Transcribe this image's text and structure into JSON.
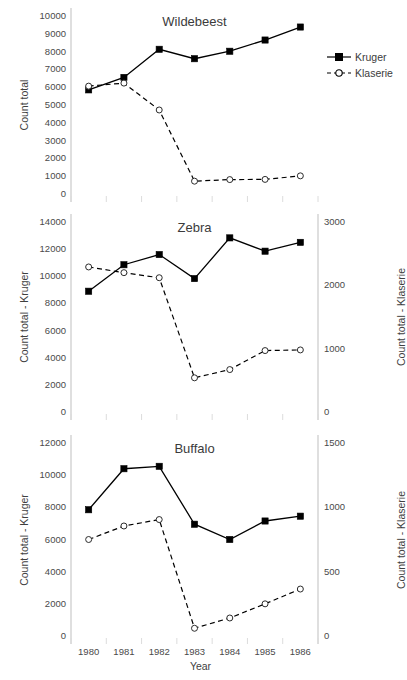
{
  "figure": {
    "xlabel": "Year",
    "legend": {
      "position": "top-right",
      "entries": [
        {
          "label": "Kruger",
          "marker": "filled-square",
          "line": "solid"
        },
        {
          "label": "Klaserie",
          "marker": "open-circle",
          "line": "dashed"
        }
      ]
    },
    "colors": {
      "line": "#000000",
      "text": "#404040",
      "grid": "#d9d9d9",
      "axis": "#bfbfbf"
    }
  },
  "chart_data": [
    {
      "type": "line",
      "title": "Wildebeest",
      "xlabel": "",
      "ylabel": "Count total",
      "y2label": "",
      "x": [
        1980,
        1981,
        1982,
        1983,
        1984,
        1985,
        1986
      ],
      "xtick_labels": [
        "1980",
        "1981",
        "1982",
        "1983",
        "1984",
        "1985",
        "1986"
      ],
      "ylim": [
        0,
        10000
      ],
      "yticks": [
        0,
        1000,
        2000,
        3000,
        4000,
        5000,
        6000,
        7000,
        8000,
        9000,
        10000
      ],
      "ytick_labels": [
        "0",
        "1000",
        "2000",
        "3000",
        "4000",
        "5000",
        "6000",
        "7000",
        "8000",
        "9000",
        "10000"
      ],
      "y2lim": null,
      "y2ticks": [],
      "y2tick_labels": [],
      "grid": false,
      "series": [
        {
          "name": "Kruger",
          "axis": "left",
          "marker": "filled-square",
          "line": "solid",
          "values": [
            5850,
            6550,
            8130,
            7600,
            8020,
            8650,
            9380
          ]
        },
        {
          "name": "Klaserie",
          "axis": "left",
          "marker": "open-circle",
          "line": "dashed",
          "values": [
            6060,
            6230,
            4720,
            720,
            810,
            820,
            1020
          ]
        }
      ]
    },
    {
      "type": "line",
      "title": "Zebra",
      "xlabel": "",
      "ylabel": "Count total - Kruger",
      "y2label": "Count total - Klaserie",
      "x": [
        1980,
        1981,
        1982,
        1983,
        1984,
        1985,
        1986
      ],
      "xtick_labels": [
        "1980",
        "1981",
        "1982",
        "1983",
        "1984",
        "1985",
        "1986"
      ],
      "ylim": [
        0,
        14000
      ],
      "yticks": [
        0,
        2000,
        4000,
        6000,
        8000,
        10000,
        12000,
        14000
      ],
      "ytick_labels": [
        "0",
        "2000",
        "4000",
        "6000",
        "8000",
        "10000",
        "12000",
        "14000"
      ],
      "y2lim": [
        0,
        3000
      ],
      "y2ticks": [
        0,
        1000,
        2000,
        3000
      ],
      "y2tick_labels": [
        "0",
        "1000",
        "2000",
        "3000"
      ],
      "grid": false,
      "series": [
        {
          "name": "Kruger",
          "axis": "left",
          "marker": "filled-square",
          "line": "solid",
          "values": [
            8900,
            10850,
            11600,
            9830,
            12830,
            11850,
            12500
          ]
        },
        {
          "name": "Klaserie",
          "axis": "right",
          "marker": "open-circle",
          "line": "dashed",
          "values": [
            2290,
            2200,
            2120,
            540,
            670,
            970,
            980
          ]
        }
      ]
    },
    {
      "type": "line",
      "title": "Buffalo",
      "xlabel": "Year",
      "ylabel": "Count total - Kruger",
      "y2label": "Count total - Klaserie",
      "x": [
        1980,
        1981,
        1982,
        1983,
        1984,
        1985,
        1986
      ],
      "xtick_labels": [
        "1980",
        "1981",
        "1982",
        "1983",
        "1984",
        "1985",
        "1986"
      ],
      "ylim": [
        0,
        12000
      ],
      "yticks": [
        0,
        2000,
        4000,
        6000,
        8000,
        10000,
        12000
      ],
      "ytick_labels": [
        "0",
        "2000",
        "4000",
        "6000",
        "8000",
        "10000",
        "12000"
      ],
      "y2lim": [
        0,
        1500
      ],
      "y2ticks": [
        0,
        500,
        1000,
        1500
      ],
      "y2tick_labels": [
        "0",
        "500",
        "1000",
        "1500"
      ],
      "grid": false,
      "series": [
        {
          "name": "Kruger",
          "axis": "left",
          "marker": "filled-square",
          "line": "solid",
          "values": [
            7850,
            10400,
            10550,
            6950,
            6000,
            7150,
            7450
          ]
        },
        {
          "name": "Klaserie",
          "axis": "right",
          "marker": "open-circle",
          "line": "dashed",
          "values": [
            750,
            855,
            905,
            60,
            140,
            250,
            365
          ]
        }
      ]
    }
  ]
}
